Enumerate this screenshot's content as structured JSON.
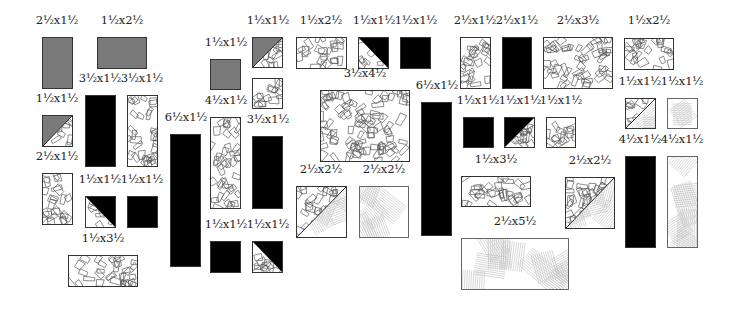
{
  "diagram": {
    "type": "quilt-cutting-diagram",
    "colors": {
      "dark": "#000000",
      "medium": "#7a7a7a",
      "print_outline": "#555555",
      "stripe_line": "#bdbdbd",
      "border": "#333333"
    },
    "pieces": [
      {
        "id": "p1",
        "label": "2½x1½",
        "fill": "gray",
        "x": 42,
        "y": 37,
        "w": 31,
        "h": 52
      },
      {
        "id": "p2",
        "label": "1½x2½",
        "fill": "gray",
        "x": 97,
        "y": 37,
        "w": 50,
        "h": 32
      },
      {
        "id": "p3",
        "label": "1½x1½",
        "fill": "half-gray-print",
        "x": 42,
        "y": 115,
        "w": 31,
        "h": 32
      },
      {
        "id": "p4",
        "label": "3½x1½",
        "fill": "black",
        "x": 85,
        "y": 95,
        "w": 31,
        "h": 72
      },
      {
        "id": "p5",
        "label": "3½x1½",
        "fill": "print",
        "x": 127,
        "y": 95,
        "w": 31,
        "h": 72
      },
      {
        "id": "p6",
        "label": "2½x1½",
        "fill": "print",
        "x": 42,
        "y": 173,
        "w": 31,
        "h": 52
      },
      {
        "id": "p7",
        "label": "1½x1½",
        "fill": "half-black-print",
        "x": 85,
        "y": 196,
        "w": 31,
        "h": 32
      },
      {
        "id": "p8",
        "label": "1½x1½",
        "fill": "black",
        "x": 127,
        "y": 196,
        "w": 31,
        "h": 32
      },
      {
        "id": "p9",
        "label": "1½x3½",
        "fill": "print",
        "x": 68,
        "y": 255,
        "w": 70,
        "h": 32
      },
      {
        "id": "p10",
        "label": "6½x1½",
        "fill": "black",
        "x": 170,
        "y": 134,
        "w": 31,
        "h": 133
      },
      {
        "id": "p11",
        "label": "1½x1½",
        "fill": "gray",
        "x": 210,
        "y": 59,
        "w": 31,
        "h": 31
      },
      {
        "id": "p12",
        "label": "1½x1½",
        "fill": "half-gray-print",
        "x": 252,
        "y": 37,
        "w": 31,
        "h": 31
      },
      {
        "id": "p13",
        "label": "",
        "fill": "print",
        "x": 252,
        "y": 78,
        "w": 31,
        "h": 31
      },
      {
        "id": "p14",
        "label": "4½x1½",
        "fill": "print",
        "x": 210,
        "y": 117,
        "w": 31,
        "h": 92
      },
      {
        "id": "p15",
        "label": "3½x1½",
        "fill": "black",
        "x": 252,
        "y": 136,
        "w": 31,
        "h": 73
      },
      {
        "id": "p16",
        "label": "1½x1½",
        "fill": "black",
        "x": 210,
        "y": 241,
        "w": 31,
        "h": 32
      },
      {
        "id": "p17",
        "label": "1½x1½",
        "fill": "half-black-print",
        "x": 252,
        "y": 241,
        "w": 31,
        "h": 32
      },
      {
        "id": "p18",
        "label": "1½x2½",
        "fill": "print",
        "x": 296,
        "y": 37,
        "w": 51,
        "h": 32
      },
      {
        "id": "p19",
        "label": "1½x1½",
        "fill": "half-black-print-tr",
        "x": 358,
        "y": 37,
        "w": 31,
        "h": 32
      },
      {
        "id": "p20",
        "label": "1½x1½",
        "fill": "black",
        "x": 400,
        "y": 37,
        "w": 31,
        "h": 32
      },
      {
        "id": "p21",
        "label": "3½x4½",
        "fill": "print",
        "x": 320,
        "y": 90,
        "w": 90,
        "h": 72
      },
      {
        "id": "p22",
        "label": "2½x2½",
        "fill": "half-print-stripe",
        "x": 296,
        "y": 186,
        "w": 51,
        "h": 52
      },
      {
        "id": "p23",
        "label": "2½x2½",
        "fill": "stripe",
        "x": 359,
        "y": 186,
        "w": 50,
        "h": 52
      },
      {
        "id": "p24",
        "label": "6½x1½",
        "fill": "black",
        "x": 421,
        "y": 102,
        "w": 31,
        "h": 134
      },
      {
        "id": "p25",
        "label": "2½x1½",
        "fill": "print",
        "x": 460,
        "y": 37,
        "w": 31,
        "h": 52
      },
      {
        "id": "p26",
        "label": "2½x1½",
        "fill": "black",
        "x": 502,
        "y": 37,
        "w": 30,
        "h": 52
      },
      {
        "id": "p27",
        "label": "2½x3½",
        "fill": "print",
        "x": 543,
        "y": 37,
        "w": 70,
        "h": 52
      },
      {
        "id": "p28",
        "label": "1½x2½",
        "fill": "print",
        "x": 624,
        "y": 38,
        "w": 50,
        "h": 32
      },
      {
        "id": "p29",
        "label": "1½x1½",
        "fill": "black",
        "x": 463,
        "y": 117,
        "w": 31,
        "h": 31
      },
      {
        "id": "p30",
        "label": "1½x1½",
        "fill": "half-black-print",
        "x": 504,
        "y": 117,
        "w": 31,
        "h": 31
      },
      {
        "id": "p31",
        "label": "1½x1½",
        "fill": "print",
        "x": 546,
        "y": 117,
        "w": 30,
        "h": 31
      },
      {
        "id": "p32",
        "label": "1½x1½",
        "fill": "half-print-stripe",
        "x": 625,
        "y": 98,
        "w": 31,
        "h": 31
      },
      {
        "id": "p33",
        "label": "1½x1½",
        "fill": "stripe",
        "x": 667,
        "y": 98,
        "w": 31,
        "h": 31
      },
      {
        "id": "p34",
        "label": "1½x3½",
        "fill": "print",
        "x": 461,
        "y": 176,
        "w": 70,
        "h": 31
      },
      {
        "id": "p35",
        "label": "2½x2½",
        "fill": "half-print-stripe",
        "x": 565,
        "y": 177,
        "w": 50,
        "h": 52
      },
      {
        "id": "p36",
        "label": "4½x1½",
        "fill": "black",
        "x": 625,
        "y": 156,
        "w": 31,
        "h": 92
      },
      {
        "id": "p37",
        "label": "4½x1½",
        "fill": "stripe",
        "x": 667,
        "y": 156,
        "w": 31,
        "h": 92
      },
      {
        "id": "p38",
        "label": "2½x5½",
        "fill": "stripe",
        "x": 461,
        "y": 238,
        "w": 108,
        "h": 52
      }
    ],
    "labels": [
      {
        "id": "p1",
        "text": "2½x1½",
        "x": 57,
        "y": 20
      },
      {
        "id": "p2",
        "text": "1½x2½",
        "x": 122,
        "y": 20
      },
      {
        "id": "p3",
        "text": "1½x1½",
        "x": 57,
        "y": 98
      },
      {
        "id": "p4",
        "text": "3½x1½",
        "x": 100,
        "y": 78
      },
      {
        "id": "p5",
        "text": "3½x1½",
        "x": 142,
        "y": 78
      },
      {
        "id": "p6",
        "text": "2½x1½",
        "x": 57,
        "y": 156
      },
      {
        "id": "p7",
        "text": "1½x1½",
        "x": 100,
        "y": 179
      },
      {
        "id": "p8",
        "text": "1½x1½",
        "x": 142,
        "y": 179
      },
      {
        "id": "p9",
        "text": "1½x3½",
        "x": 103,
        "y": 238
      },
      {
        "id": "p10",
        "text": "6½x1½",
        "x": 186,
        "y": 117
      },
      {
        "id": "p11",
        "text": "1½x1½",
        "x": 226,
        "y": 42
      },
      {
        "id": "p12",
        "text": "1½x1½",
        "x": 268,
        "y": 20
      },
      {
        "id": "p14",
        "text": "4½x1½",
        "x": 226,
        "y": 100
      },
      {
        "id": "p15",
        "text": "3½x1½",
        "x": 268,
        "y": 119
      },
      {
        "id": "p16",
        "text": "1½x1½",
        "x": 226,
        "y": 224
      },
      {
        "id": "p17",
        "text": "1½x1½",
        "x": 268,
        "y": 224
      },
      {
        "id": "p18",
        "text": "1½x2½",
        "x": 321,
        "y": 20
      },
      {
        "id": "p19",
        "text": "1½x1½",
        "x": 374,
        "y": 20
      },
      {
        "id": "p20",
        "text": "1½x1½",
        "x": 416,
        "y": 20
      },
      {
        "id": "p21",
        "text": "3½x4½",
        "x": 365,
        "y": 73
      },
      {
        "id": "p22",
        "text": "2½x2½",
        "x": 321,
        "y": 169
      },
      {
        "id": "p23",
        "text": "2½x2½",
        "x": 384,
        "y": 169
      },
      {
        "id": "p24",
        "text": "6½x1½",
        "x": 437,
        "y": 85
      },
      {
        "id": "p25",
        "text": "2½x1½",
        "x": 475,
        "y": 20
      },
      {
        "id": "p26",
        "text": "2½x1½",
        "x": 517,
        "y": 20
      },
      {
        "id": "p27",
        "text": "2½x3½",
        "x": 578,
        "y": 20
      },
      {
        "id": "p28",
        "text": "1½x2½",
        "x": 649,
        "y": 20
      },
      {
        "id": "p29",
        "text": "1½x1½",
        "x": 478,
        "y": 100
      },
      {
        "id": "p30",
        "text": "1½x1½",
        "x": 520,
        "y": 100
      },
      {
        "id": "p31",
        "text": "1½x1½",
        "x": 561,
        "y": 100
      },
      {
        "id": "p32",
        "text": "1½x1½",
        "x": 640,
        "y": 81
      },
      {
        "id": "p33",
        "text": "1½x1½",
        "x": 682,
        "y": 81
      },
      {
        "id": "p34",
        "text": "1½x3½",
        "x": 496,
        "y": 159
      },
      {
        "id": "p35",
        "text": "2½x2½",
        "x": 590,
        "y": 160
      },
      {
        "id": "p36",
        "text": "4½x1½",
        "x": 640,
        "y": 139
      },
      {
        "id": "p37",
        "text": "4½x1½",
        "x": 682,
        "y": 139
      },
      {
        "id": "p38",
        "text": "2½x5½",
        "x": 515,
        "y": 221
      }
    ]
  }
}
